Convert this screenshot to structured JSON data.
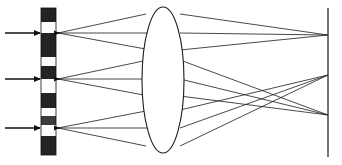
{
  "figure": {
    "type": "ray-trace",
    "canvas": {
      "width": 342,
      "height": 165,
      "background": "#ffffff"
    },
    "colors": {
      "ray": "#1a1a1a",
      "lens_outline": "#1a1a1a",
      "lens_fill": "#ffffff",
      "screen": "#3a3a3a",
      "arrow": "#111111",
      "mask_dark": "#232323",
      "mask_light": "#fdfdfd",
      "mask_mid": "#3c3c3c"
    }
  },
  "mask": {
    "label": "striped-mask",
    "x": 41,
    "y": 8,
    "width": 15,
    "height": 147,
    "bands": [
      {
        "y": 8,
        "height": 14,
        "tone": "dark"
      },
      {
        "y": 22,
        "height": 11,
        "tone": "light"
      },
      {
        "y": 33,
        "height": 24,
        "tone": "dark"
      },
      {
        "y": 57,
        "height": 9,
        "tone": "light"
      },
      {
        "y": 66,
        "height": 13,
        "tone": "dark"
      },
      {
        "y": 79,
        "height": 14,
        "tone": "light"
      },
      {
        "y": 93,
        "height": 15,
        "tone": "dark"
      },
      {
        "y": 108,
        "height": 8,
        "tone": "light"
      },
      {
        "y": 116,
        "height": 9,
        "tone": "mid"
      },
      {
        "y": 125,
        "height": 11,
        "tone": "light"
      },
      {
        "y": 136,
        "height": 19,
        "tone": "dark"
      }
    ]
  },
  "incoming_rays": [
    {
      "label": "incoming-ray-top",
      "x1": 5,
      "y1": 33,
      "x2": 41,
      "y2": 33
    },
    {
      "label": "incoming-ray-middle",
      "x1": 5,
      "y1": 79,
      "x2": 41,
      "y2": 79
    },
    {
      "label": "incoming-ray-bottom",
      "x1": 5,
      "y1": 128,
      "x2": 41,
      "y2": 128
    }
  ],
  "object_points": [
    {
      "label": "object-point-top",
      "x": 58,
      "y": 33
    },
    {
      "label": "object-point-middle",
      "x": 58,
      "y": 79
    },
    {
      "label": "object-point-bottom",
      "x": 58,
      "y": 128
    }
  ],
  "lens": {
    "label": "converging-lens",
    "cx": 163,
    "cy": 80,
    "rx": 21,
    "ry": 73
  },
  "screen": {
    "label": "image-screen",
    "x": 328,
    "y1": 8,
    "y2": 157
  },
  "image_points": [
    {
      "label": "image-point-top",
      "x": 328,
      "y": 35
    },
    {
      "label": "image-point-middle",
      "x": 328,
      "y": 75
    },
    {
      "label": "image-point-bottom",
      "x": 328,
      "y": 115
    }
  ],
  "lens_entry_points": {
    "from_top": [
      {
        "x": 146,
        "y": 14
      },
      {
        "x": 148,
        "y": 33
      },
      {
        "x": 150,
        "y": 49
      }
    ],
    "from_middle": [
      {
        "x": 146,
        "y": 60
      },
      {
        "x": 148,
        "y": 79
      },
      {
        "x": 149,
        "y": 95
      }
    ],
    "from_bottom": [
      {
        "x": 150,
        "y": 108
      },
      {
        "x": 148,
        "y": 128
      },
      {
        "x": 146,
        "y": 145
      }
    ]
  },
  "lens_exit_points": {
    "to_top": [
      {
        "x": 180,
        "y": 14
      },
      {
        "x": 180,
        "y": 33
      },
      {
        "x": 180,
        "y": 49
      }
    ],
    "to_middle": [
      {
        "x": 180,
        "y": 60
      },
      {
        "x": 180,
        "y": 79
      },
      {
        "x": 180,
        "y": 95
      }
    ],
    "to_bottom": [
      {
        "x": 180,
        "y": 108
      },
      {
        "x": 180,
        "y": 128
      },
      {
        "x": 180,
        "y": 145
      }
    ]
  },
  "ray_bundles": [
    {
      "label": "bundle-top",
      "source": {
        "x": 58,
        "y": 33
      },
      "target": {
        "x": 328,
        "y": 35
      },
      "lens_in": [
        {
          "x": 146,
          "y": 14
        },
        {
          "x": 148,
          "y": 33
        },
        {
          "x": 151,
          "y": 50
        }
      ],
      "lens_out": [
        {
          "x": 180,
          "y": 14
        },
        {
          "x": 180,
          "y": 33
        },
        {
          "x": 180,
          "y": 50
        }
      ]
    },
    {
      "label": "bundle-middle",
      "source": {
        "x": 58,
        "y": 79
      },
      "target": {
        "x": 328,
        "y": 115
      },
      "lens_in": [
        {
          "x": 148,
          "y": 60
        },
        {
          "x": 149,
          "y": 79
        },
        {
          "x": 149,
          "y": 96
        }
      ],
      "lens_out": [
        {
          "x": 180,
          "y": 60
        },
        {
          "x": 180,
          "y": 79
        },
        {
          "x": 180,
          "y": 96
        }
      ]
    },
    {
      "label": "bundle-bottom",
      "source": {
        "x": 58,
        "y": 128
      },
      "target": {
        "x": 328,
        "y": 75
      },
      "lens_in": [
        {
          "x": 151,
          "y": 110
        },
        {
          "x": 149,
          "y": 128
        },
        {
          "x": 146,
          "y": 146
        }
      ],
      "lens_out": [
        {
          "x": 180,
          "y": 110
        },
        {
          "x": 180,
          "y": 128
        },
        {
          "x": 180,
          "y": 146
        }
      ]
    }
  ]
}
